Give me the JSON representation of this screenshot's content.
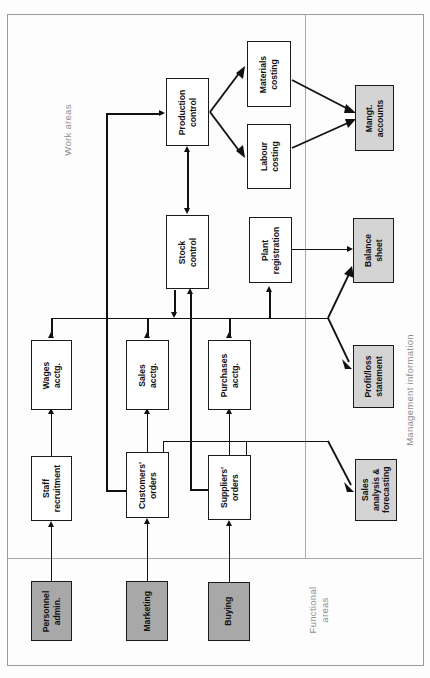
{
  "figure": {
    "type": "flow-diagram",
    "orientation": "rotated-90-ccw",
    "sections": [
      {
        "id": "work-areas",
        "label": "Work areas"
      },
      {
        "id": "management-information",
        "label": "Management information"
      },
      {
        "id": "functional-areas",
        "label": "Functional\nareas"
      }
    ],
    "colors": {
      "node_fill": "#ffffff",
      "functional_fill": "#a8a8a8",
      "management_fill": "#d4d4d4",
      "stroke": "#111111",
      "divider": "#a8a8a8",
      "section_label": "#8d8d8d"
    },
    "nodes": [
      {
        "id": "production-control",
        "label": "Production control",
        "style": "plain"
      },
      {
        "id": "materials-costing",
        "label": "Materials costing",
        "style": "plain"
      },
      {
        "id": "labour-costing",
        "label": "Labour costing",
        "style": "plain"
      },
      {
        "id": "mangt-accounts",
        "label": "Mangt. accounts",
        "style": "management"
      },
      {
        "id": "stock-control",
        "label": "Stock control",
        "style": "plain"
      },
      {
        "id": "plant-registration",
        "label": "Plant registration",
        "style": "plain"
      },
      {
        "id": "balance-sheet",
        "label": "Balance sheet",
        "style": "management"
      },
      {
        "id": "profit-loss",
        "label": "Profit/loss statement",
        "style": "management"
      },
      {
        "id": "sales-analysis",
        "label": "Sales analysis & forecasting",
        "style": "management"
      },
      {
        "id": "wages-acctg",
        "label": "Wages acctg.",
        "style": "plain"
      },
      {
        "id": "sales-acctg",
        "label": "Sales acctg.",
        "style": "plain"
      },
      {
        "id": "purchases-acctg",
        "label": "Purchases acctg.",
        "style": "plain"
      },
      {
        "id": "staff-recruitment",
        "label": "Staff recruitment",
        "style": "plain"
      },
      {
        "id": "customers-orders",
        "label": "Customers' orders",
        "style": "plain"
      },
      {
        "id": "suppliers-orders",
        "label": "Suppliers' orders",
        "style": "plain"
      },
      {
        "id": "personnel-admin",
        "label": "Personnel admin.",
        "style": "functional"
      },
      {
        "id": "marketing",
        "label": "Marketing",
        "style": "functional"
      },
      {
        "id": "buying",
        "label": "Buying",
        "style": "functional"
      }
    ],
    "node_labels": {
      "production-control": {
        "l1": "Production",
        "l2": "control"
      },
      "materials-costing": {
        "l1": "Materials",
        "l2": "costing"
      },
      "labour-costing": {
        "l1": "Labour",
        "l2": "costing"
      },
      "mangt-accounts": {
        "l1": "Mangt.",
        "l2": "accounts"
      },
      "stock-control": {
        "l1": "Stock",
        "l2": "control"
      },
      "plant-registration": {
        "l1": "Plant",
        "l2": "registration"
      },
      "balance-sheet": {
        "l1": "Balance",
        "l2": "sheet"
      },
      "profit-loss": {
        "l1": "Profit/loss",
        "l2": "statement"
      },
      "sales-analysis": {
        "l1": "Sales",
        "l2": "analysis &",
        "l3": "forecasting"
      },
      "wages-acctg": {
        "l1": "Wages",
        "l2": "acctg."
      },
      "sales-acctg": {
        "l1": "Sales",
        "l2": "acctg."
      },
      "purchases-acctg": {
        "l1": "Purchases",
        "l2": "acctg."
      },
      "staff-recruitment": {
        "l1": "Staff",
        "l2": "recruitment"
      },
      "customers-orders": {
        "l1": "Customers'",
        "l2": "orders"
      },
      "suppliers-orders": {
        "l1": "Suppliers'",
        "l2": "orders"
      },
      "personnel-admin": {
        "l1": "Personnel",
        "l2": "admin."
      },
      "marketing": {
        "l1": "Marketing",
        "l2": ""
      },
      "buying": {
        "l1": "Buying",
        "l2": ""
      }
    },
    "edges": [
      {
        "from": "personnel-admin",
        "to": "staff-recruitment"
      },
      {
        "from": "staff-recruitment",
        "to": "wages-acctg"
      },
      {
        "from": "marketing",
        "to": "customers-orders"
      },
      {
        "from": "customers-orders",
        "to": "sales-acctg"
      },
      {
        "from": "customers-orders",
        "to": "production-control"
      },
      {
        "from": "buying",
        "to": "suppliers-orders"
      },
      {
        "from": "suppliers-orders",
        "to": "purchases-acctg"
      },
      {
        "from": "suppliers-orders",
        "to": "stock-control"
      },
      {
        "from": "production-control",
        "to": "stock-control"
      },
      {
        "from": "stock-control",
        "to": "production-control"
      },
      {
        "from": "production-control",
        "to": "materials-costing"
      },
      {
        "from": "production-control",
        "to": "labour-costing"
      },
      {
        "from": "materials-costing",
        "to": "mangt-accounts"
      },
      {
        "from": "labour-costing",
        "to": "mangt-accounts"
      },
      {
        "from": "plant-registration",
        "to": "balance-sheet"
      },
      {
        "from": "ledger-bus",
        "to": "balance-sheet"
      },
      {
        "from": "ledger-bus",
        "to": "profit-loss"
      },
      {
        "from": "orders-bus",
        "to": "sales-analysis"
      },
      {
        "from": "wages-acctg",
        "to": "ledger-bus"
      },
      {
        "from": "sales-acctg",
        "to": "ledger-bus"
      },
      {
        "from": "purchases-acctg",
        "to": "ledger-bus"
      },
      {
        "from": "stock-control",
        "to": "ledger-bus"
      }
    ]
  }
}
